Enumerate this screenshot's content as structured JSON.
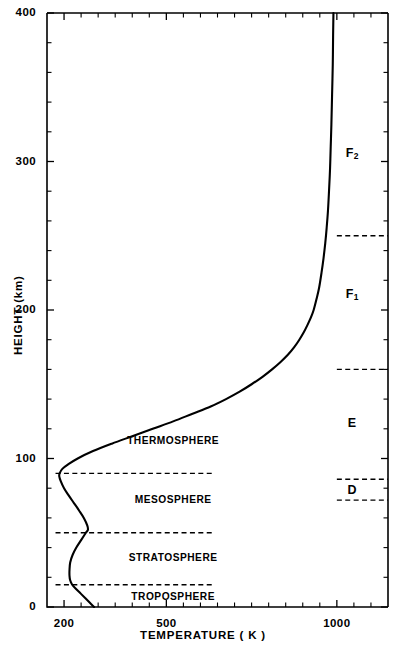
{
  "chart_data": {
    "type": "line",
    "title": "",
    "xlabel": "TEMPERATURE ( K )",
    "ylabel": "HEIGHT  (km)",
    "xlim": [
      150,
      1150
    ],
    "ylim": [
      0,
      400
    ],
    "xscale": "linear",
    "yscale": "linear",
    "grid": false,
    "legend": null,
    "x_tick_labels": [
      "200",
      "500",
      "1000"
    ],
    "x_tick_values": [
      200,
      500,
      1000
    ],
    "x_minor_tick_values": [
      250,
      300,
      350,
      400,
      450,
      550,
      600,
      650,
      700,
      750,
      800,
      850,
      900,
      950,
      1050,
      1100
    ],
    "y_tick_labels": [
      "0",
      "100",
      "200",
      "300",
      "400"
    ],
    "y_tick_values": [
      0,
      100,
      200,
      300,
      400
    ],
    "y_minor_step": 20,
    "series": [
      {
        "name": "Temperature profile",
        "xlabel_note": "Temperature (K)",
        "ylabel_note": "Height (km)",
        "points_ty": [
          [
            288,
            0
          ],
          [
            275,
            3
          ],
          [
            262,
            6
          ],
          [
            249,
            9
          ],
          [
            236,
            12
          ],
          [
            224,
            15
          ],
          [
            218,
            18
          ],
          [
            216,
            21
          ],
          [
            216,
            25
          ],
          [
            218,
            30
          ],
          [
            225,
            35
          ],
          [
            236,
            40
          ],
          [
            250,
            45
          ],
          [
            264,
            50
          ],
          [
            270,
            52
          ],
          [
            268,
            55
          ],
          [
            258,
            60
          ],
          [
            244,
            65
          ],
          [
            229,
            70
          ],
          [
            214,
            75
          ],
          [
            200,
            80
          ],
          [
            190,
            85
          ],
          [
            186,
            88
          ],
          [
            187,
            90
          ],
          [
            195,
            93
          ],
          [
            212,
            96
          ],
          [
            240,
            100
          ],
          [
            285,
            105
          ],
          [
            340,
            110
          ],
          [
            400,
            115
          ],
          [
            460,
            120
          ],
          [
            520,
            125
          ],
          [
            575,
            130
          ],
          [
            630,
            135
          ],
          [
            675,
            140
          ],
          [
            715,
            145
          ],
          [
            750,
            150
          ],
          [
            782,
            155
          ],
          [
            810,
            160
          ],
          [
            835,
            165
          ],
          [
            857,
            170
          ],
          [
            875,
            175
          ],
          [
            890,
            180
          ],
          [
            903,
            185
          ],
          [
            914,
            190
          ],
          [
            924,
            195
          ],
          [
            932,
            200
          ],
          [
            940,
            207
          ],
          [
            948,
            215
          ],
          [
            955,
            225
          ],
          [
            961,
            235
          ],
          [
            966,
            245
          ],
          [
            970,
            255
          ],
          [
            974,
            267
          ],
          [
            977,
            280
          ],
          [
            980,
            295
          ],
          [
            982,
            310
          ],
          [
            984,
            325
          ],
          [
            986,
            345
          ],
          [
            988,
            365
          ],
          [
            989,
            385
          ],
          [
            990,
            400
          ]
        ]
      }
    ],
    "annotations": {
      "atmosphere_layers": [
        {
          "label": "THERMOSPHERE",
          "temp_pos": 520,
          "height_pos": 112
        },
        {
          "label": "MESOSPHERE",
          "temp_pos": 520,
          "height_pos": 72
        },
        {
          "label": "STRATOSPHERE",
          "temp_pos": 520,
          "height_pos": 33
        },
        {
          "label": "TROPOSPHERE",
          "temp_pos": 520,
          "height_pos": 7
        }
      ],
      "atmosphere_boundaries": [
        {
          "name": "mesopause",
          "height": 90,
          "temp_start": 175,
          "temp_end": 640
        },
        {
          "name": "stratopause",
          "height": 50,
          "temp_start": 175,
          "temp_end": 640
        },
        {
          "name": "tropopause",
          "height": 15,
          "temp_start": 175,
          "temp_end": 640
        }
      ],
      "ionosphere_layers": [
        {
          "label": "F",
          "subscript": "2",
          "height_pos": 305
        },
        {
          "label": "F",
          "subscript": "1",
          "height_pos": 210
        },
        {
          "label": "E",
          "subscript": "",
          "height_pos": 123
        },
        {
          "label": "D",
          "subscript": "",
          "height_pos": 78
        }
      ],
      "ionosphere_boundaries": [
        {
          "name": "F2-F1",
          "height": 250,
          "temp_start": 1000,
          "temp_end": 1150
        },
        {
          "name": "F1-E",
          "height": 160,
          "temp_start": 1000,
          "temp_end": 1150
        },
        {
          "name": "E-D-top",
          "height": 86,
          "temp_start": 1000,
          "temp_end": 1150
        },
        {
          "name": "D-bottom",
          "height": 72,
          "temp_start": 1000,
          "temp_end": 1150
        }
      ]
    },
    "colors": {
      "curve": "#000000",
      "axis": "#000000",
      "background": "#ffffff"
    }
  }
}
